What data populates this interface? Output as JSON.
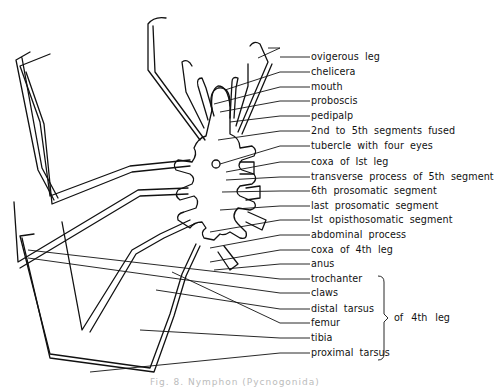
{
  "figure": {
    "labels": [
      {
        "text": "ovigerous leg",
        "y": 57
      },
      {
        "text": "chelicera",
        "y": 72
      },
      {
        "text": "mouth",
        "y": 87
      },
      {
        "text": "proboscis",
        "y": 101
      },
      {
        "text": "pedipalp",
        "y": 116
      },
      {
        "text": "2nd to 5th segments fused",
        "y": 131
      },
      {
        "text": "tubercle with four eyes",
        "y": 146
      },
      {
        "text": "coxa of Ist leg",
        "y": 162
      },
      {
        "text": "transverse process of 5th segment",
        "y": 177
      },
      {
        "text": "6th prosomatic segment",
        "y": 191
      },
      {
        "text": "last prosomatic segment",
        "y": 206
      },
      {
        "text": "Ist opisthosomatic segment",
        "y": 220
      },
      {
        "text": "abdominal process",
        "y": 235
      },
      {
        "text": "coxa of 4th leg",
        "y": 250
      },
      {
        "text": "anus",
        "y": 264
      },
      {
        "text": "trochanter",
        "y": 279
      },
      {
        "text": "claws",
        "y": 293
      },
      {
        "text": "distal tarsus",
        "y": 309
      },
      {
        "text": "femur",
        "y": 323
      },
      {
        "text": "tibia",
        "y": 338
      },
      {
        "text": "proximal tarsus",
        "y": 353
      }
    ],
    "bracket_label": "of 4th leg",
    "caption": "Fig. 8. Nymphon (Pycnogonida)"
  }
}
